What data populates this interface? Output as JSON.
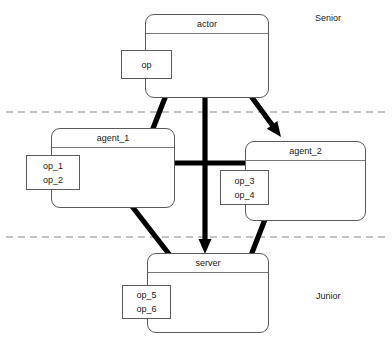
{
  "diagram": {
    "type": "uml-collaboration-diagram",
    "background_color": "#ffffff",
    "line_color": "#5a5a5a",
    "arrow_color": "#000000",
    "tier_divider_color": "#888888",
    "tiers": [
      {
        "id": "tier-senior",
        "label": "Senior",
        "label_x": 315,
        "label_y": 13
      },
      {
        "id": "tier-middle",
        "label": "",
        "label_x": 0,
        "label_y": 0
      },
      {
        "id": "tier-junior",
        "label": "Junior",
        "label_x": 316,
        "label_y": 291
      }
    ],
    "dividers": [
      {
        "id": "divider-senior-middle",
        "y": 112
      },
      {
        "id": "divider-middle-junior",
        "y": 237
      }
    ],
    "classes": [
      {
        "id": "actor",
        "name": "actor",
        "x": 145,
        "y": 14,
        "w": 124,
        "h": 84,
        "operations": {
          "id": "op-actor",
          "lines": [
            "op"
          ],
          "x": 121,
          "y": 50,
          "w": 51,
          "h": 29
        }
      },
      {
        "id": "agent_1",
        "name": "agent_1",
        "x": 51,
        "y": 128,
        "w": 124,
        "h": 80,
        "operations": {
          "id": "op-agent-1",
          "lines": [
            "op_1",
            "op_2"
          ],
          "x": 26,
          "y": 155,
          "w": 54,
          "h": 35
        }
      },
      {
        "id": "agent_2",
        "name": "agent_2",
        "x": 245,
        "y": 141,
        "w": 121,
        "h": 80,
        "operations": {
          "id": "op-agent-2",
          "lines": [
            "op_3",
            "op_4"
          ],
          "x": 220,
          "y": 170,
          "w": 49,
          "h": 35
        }
      },
      {
        "id": "server",
        "name": "server",
        "x": 147,
        "y": 253,
        "w": 122,
        "h": 80,
        "operations": {
          "id": "op-server",
          "lines": [
            "op_5",
            "op_6"
          ],
          "x": 122,
          "y": 285,
          "w": 49,
          "h": 34
        }
      }
    ],
    "arrows": [
      {
        "id": "arrow-actor-to-agent1",
        "from": "actor",
        "to": "agent_1",
        "x1": 168,
        "y1": 90,
        "x2": 140,
        "y2": 162
      },
      {
        "id": "arrow-actor-to-agent2",
        "from": "actor",
        "to": "agent_2",
        "x1": 245,
        "y1": 88,
        "x2": 281,
        "y2": 137
      },
      {
        "id": "arrow-actor-to-server",
        "from": "actor",
        "to": "server",
        "x1": 205,
        "y1": 84,
        "x2": 205,
        "y2": 254
      },
      {
        "id": "arrow-agent1-to-agent2",
        "from": "agent_1",
        "to": "agent_2",
        "x1": 157,
        "y1": 163,
        "x2": 264,
        "y2": 163
      },
      {
        "id": "arrow-agent1-to-server",
        "from": "agent_1",
        "to": "server",
        "x1": 124,
        "y1": 196,
        "x2": 193,
        "y2": 285
      },
      {
        "id": "arrow-agent2-to-server",
        "from": "agent_2",
        "to": "server",
        "x1": 271,
        "y1": 204,
        "x2": 239,
        "y2": 286
      }
    ],
    "caption": "",
    "caption_y": 340
  }
}
